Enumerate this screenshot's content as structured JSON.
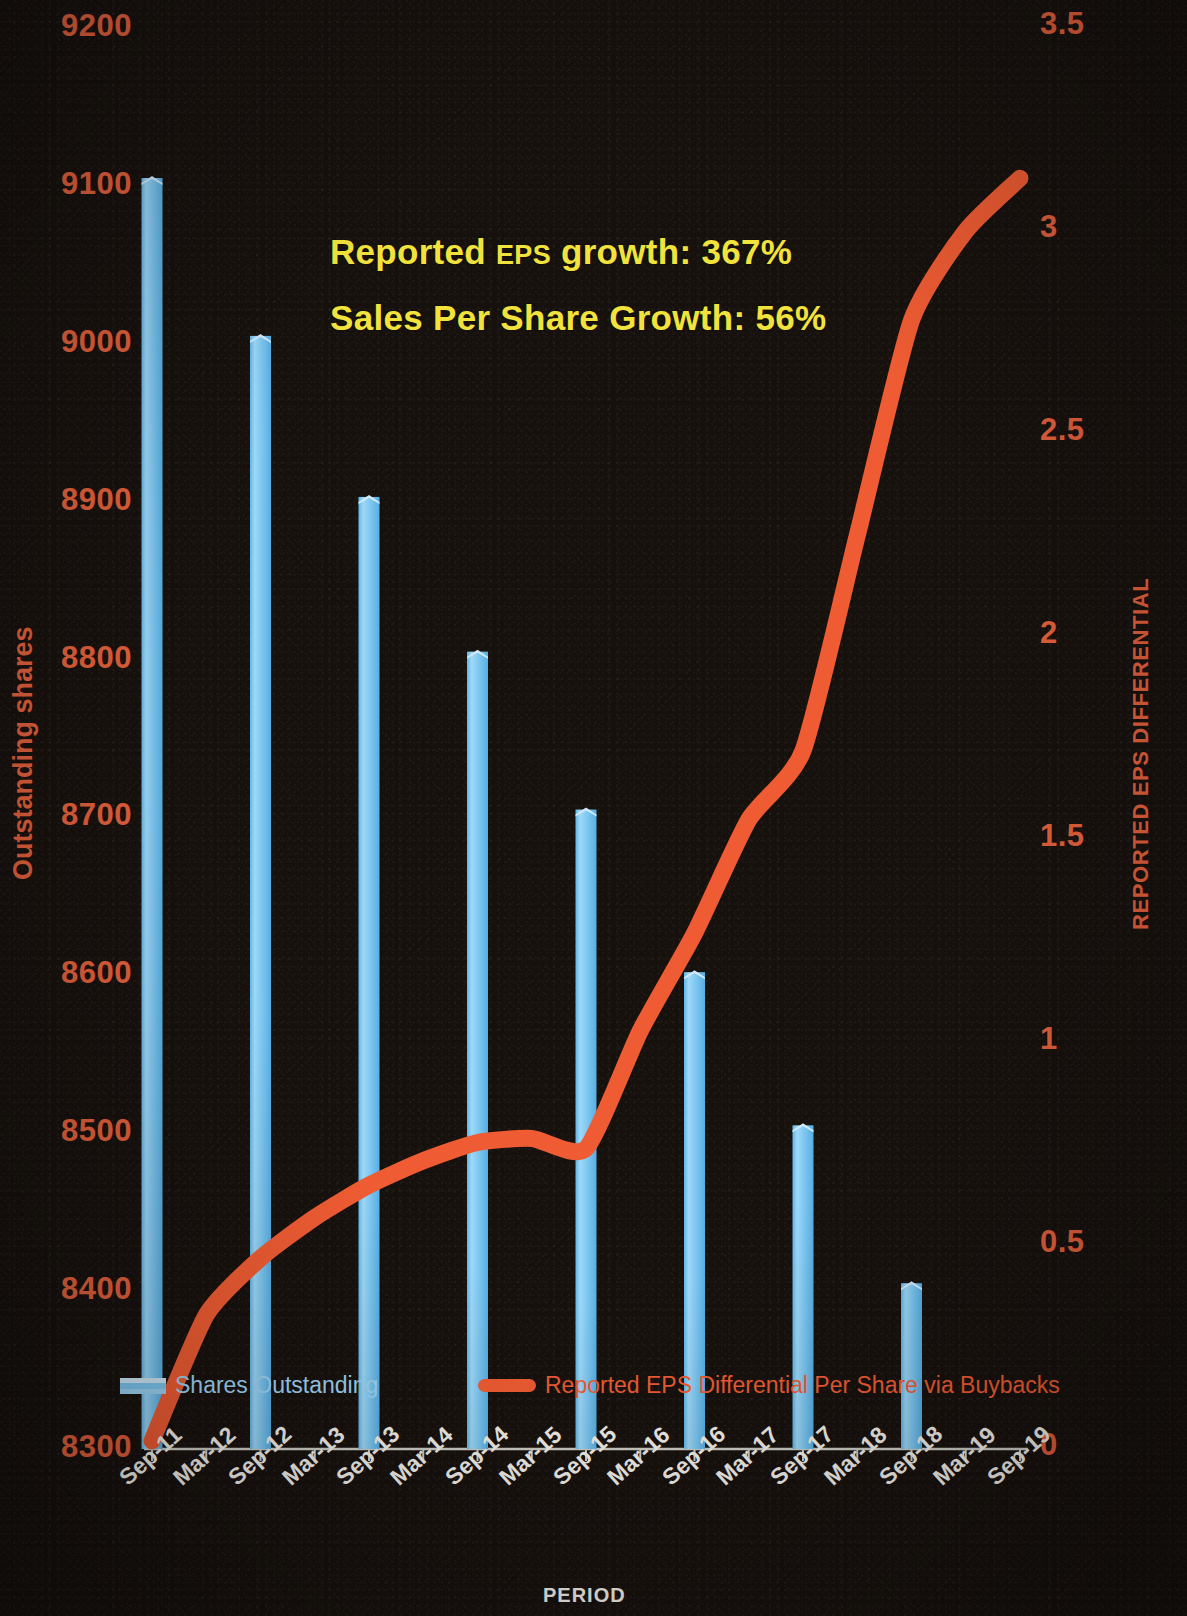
{
  "chart_data": {
    "type": "bar",
    "title": "",
    "xlabel": "PERIOD",
    "ylabel": "Outstanding shares",
    "y2label": "REPORTED EPS DIFFERENTIAL",
    "grid": false,
    "legend_position": "bottom-inside",
    "categories": [
      "Sep-11",
      "Mar-12",
      "Sep-12",
      "Mar-13",
      "Sep-13",
      "Mar-14",
      "Sep-14",
      "Mar-15",
      "Sep-15",
      "Mar-16",
      "Sep-16",
      "Mar-17",
      "Sep-17",
      "Mar-18",
      "Sep-18",
      "Mar-19",
      "Sep-19"
    ],
    "ylim": [
      8300,
      9200
    ],
    "yticks": [
      "9200",
      "9100",
      "9000",
      "8900",
      "8800",
      "8700",
      "8600",
      "8500",
      "8400",
      "8300"
    ],
    "y2lim": [
      0,
      3.5
    ],
    "y2ticks": [
      "3.5",
      "3",
      "2.5",
      "2",
      "1.5",
      "1",
      "0.5",
      "0"
    ],
    "series": [
      {
        "name": "Shares Outstanding",
        "axis": "left",
        "type": "bar",
        "color": "#7ec8f2",
        "values": [
          9105,
          null,
          9005,
          null,
          8903,
          null,
          8805,
          null,
          8705,
          null,
          8602,
          null,
          8505,
          null,
          8405,
          null,
          null
        ]
      },
      {
        "name": "Reported EPS Differential Per Share via Buybacks",
        "axis": "right",
        "type": "line",
        "color": "#ef5c33",
        "values": [
          0.02,
          0.33,
          0.47,
          0.57,
          0.65,
          0.71,
          0.755,
          0.765,
          0.74,
          1.03,
          1.27,
          1.55,
          1.72,
          2.25,
          2.78,
          3.0,
          3.13
        ]
      }
    ],
    "annotations": [
      {
        "text_main": "Reported ",
        "text_small": "EPS",
        "text_rest": " growth: 367%"
      },
      {
        "text_main": "Sales Per  Share Growth: 56%",
        "text_small": "",
        "text_rest": ""
      }
    ]
  },
  "legend": {
    "bar_label": "Shares Outstanding",
    "line_label": "Reported EPS Differential Per Share via Buybacks"
  },
  "colors": {
    "bar": "#7ec8f2",
    "line": "#ef5c33",
    "axis_text": "#e2603c",
    "xtick_text": "#f2efe9",
    "annotation": "#f2e33c",
    "background": "#17110d"
  }
}
